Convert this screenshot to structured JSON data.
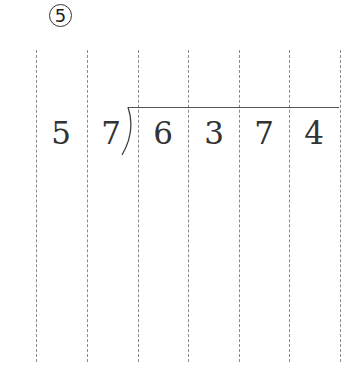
{
  "problem": {
    "number_label": "5",
    "divisor": [
      "5",
      "7"
    ],
    "dividend": [
      "6",
      "3",
      "7",
      "4"
    ]
  },
  "grid": {
    "line_positions_x": [
      36,
      87,
      138,
      188,
      239,
      289,
      340
    ]
  }
}
